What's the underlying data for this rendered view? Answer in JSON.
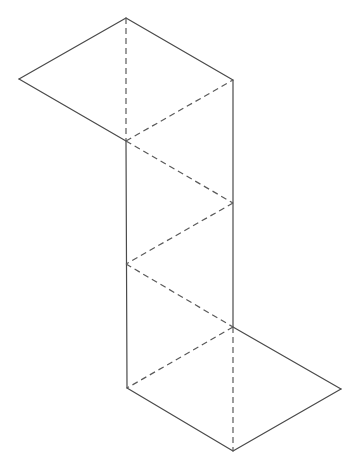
{
  "diagram": {
    "type": "polyhedron-net",
    "colors": {
      "background": "#ffffff",
      "solid_edge": "#4a4a4a",
      "fold_edge": "#5a5a5a"
    },
    "vertices": {
      "A": [
        126,
        18
      ],
      "B": [
        19,
        79
      ],
      "C": [
        233,
        80
      ],
      "D": [
        126,
        141
      ],
      "E": [
        233,
        203
      ],
      "F": [
        126,
        264
      ],
      "G": [
        233,
        327
      ],
      "H": [
        127,
        388
      ],
      "I": [
        341,
        389
      ],
      "J": [
        233,
        451
      ]
    },
    "solid_edges": [
      [
        "A",
        "B"
      ],
      [
        "A",
        "C"
      ],
      [
        "B",
        "D"
      ],
      [
        "D",
        "H"
      ],
      [
        "C",
        "G"
      ],
      [
        "H",
        "J"
      ],
      [
        "J",
        "I"
      ],
      [
        "I",
        "G"
      ]
    ],
    "fold_edges": [
      [
        "A",
        "D"
      ],
      [
        "D",
        "C"
      ],
      [
        "D",
        "E"
      ],
      [
        "E",
        "F"
      ],
      [
        "F",
        "G"
      ],
      [
        "G",
        "H"
      ],
      [
        "G",
        "J"
      ]
    ],
    "faces": 8,
    "labels": []
  }
}
